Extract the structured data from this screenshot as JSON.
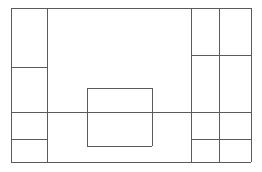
{
  "figure": {
    "title": "",
    "caption": "",
    "type": "layout-wireframe",
    "background_color": "#ffffff",
    "stroke_color": "#5a5a5a",
    "stroke_color_light": "#7a7a7a",
    "stroke_width": 1,
    "width": 262,
    "height": 172
  },
  "chart_data": {
    "type": "diagram",
    "title": "",
    "xlabel": "",
    "ylabel": "",
    "canvas": {
      "x": 11,
      "y": 8,
      "width": 240,
      "height": 154
    },
    "regions": [
      {
        "name": "left-sidebar-cell-1",
        "x": 11,
        "y": 8,
        "width": 36,
        "height": 59
      },
      {
        "name": "left-sidebar-cell-2",
        "x": 11,
        "y": 67,
        "width": 36,
        "height": 45
      },
      {
        "name": "left-sidebar-cell-3",
        "x": 11,
        "y": 112,
        "width": 36,
        "height": 27
      },
      {
        "name": "left-sidebar-cell-4",
        "x": 11,
        "y": 139,
        "width": 36,
        "height": 23
      },
      {
        "name": "main-content-upper",
        "x": 47,
        "y": 8,
        "width": 144,
        "height": 104
      },
      {
        "name": "main-content-lower",
        "x": 47,
        "y": 112,
        "width": 144,
        "height": 50
      },
      {
        "name": "right-inner-cell-1",
        "x": 191,
        "y": 8,
        "width": 28,
        "height": 47
      },
      {
        "name": "right-inner-cell-2",
        "x": 191,
        "y": 55,
        "width": 28,
        "height": 57
      },
      {
        "name": "right-inner-cell-3",
        "x": 191,
        "y": 112,
        "width": 28,
        "height": 27
      },
      {
        "name": "right-inner-cell-4",
        "x": 191,
        "y": 139,
        "width": 28,
        "height": 23
      },
      {
        "name": "right-outer-cell-1",
        "x": 219,
        "y": 8,
        "width": 32,
        "height": 47
      },
      {
        "name": "right-outer-cell-2",
        "x": 219,
        "y": 55,
        "width": 32,
        "height": 57
      },
      {
        "name": "right-outer-cell-3",
        "x": 219,
        "y": 112,
        "width": 32,
        "height": 27
      },
      {
        "name": "right-outer-cell-4",
        "x": 219,
        "y": 139,
        "width": 32,
        "height": 23
      },
      {
        "name": "center-floating-block",
        "x": 87,
        "y": 88,
        "width": 65,
        "height": 58
      }
    ],
    "lines": [
      {
        "name": "outer-frame-top",
        "orientation": "horizontal",
        "x1": 11,
        "y1": 8,
        "x2": 251,
        "y2": 8
      },
      {
        "name": "outer-frame-bottom",
        "orientation": "horizontal",
        "x1": 11,
        "y1": 162,
        "x2": 251,
        "y2": 162
      },
      {
        "name": "outer-frame-left",
        "orientation": "vertical",
        "x1": 11,
        "y1": 8,
        "x2": 11,
        "y2": 162
      },
      {
        "name": "outer-frame-right",
        "orientation": "vertical",
        "x1": 251,
        "y1": 8,
        "x2": 251,
        "y2": 162
      },
      {
        "name": "left-sidebar-divider",
        "orientation": "vertical",
        "x1": 47,
        "y1": 8,
        "x2": 47,
        "y2": 162
      },
      {
        "name": "right-inner-divider",
        "orientation": "vertical",
        "x1": 191,
        "y1": 8,
        "x2": 191,
        "y2": 162
      },
      {
        "name": "right-outer-divider",
        "orientation": "vertical",
        "x1": 219,
        "y1": 8,
        "x2": 219,
        "y2": 162
      },
      {
        "name": "left-rule-upper",
        "orientation": "horizontal",
        "x1": 11,
        "y1": 67,
        "x2": 47,
        "y2": 67
      },
      {
        "name": "left-rule-lower",
        "orientation": "horizontal",
        "x1": 11,
        "y1": 139,
        "x2": 47,
        "y2": 139
      },
      {
        "name": "right-rule-upper",
        "orientation": "horizontal",
        "x1": 191,
        "y1": 55,
        "x2": 251,
        "y2": 55
      },
      {
        "name": "right-rule-lower",
        "orientation": "horizontal",
        "x1": 191,
        "y1": 139,
        "x2": 251,
        "y2": 139
      },
      {
        "name": "full-width-rule",
        "orientation": "horizontal",
        "x1": 11,
        "y1": 112,
        "x2": 251,
        "y2": 112
      },
      {
        "name": "center-block-top",
        "orientation": "horizontal",
        "x1": 87,
        "y1": 88,
        "x2": 152,
        "y2": 88
      },
      {
        "name": "center-block-bottom",
        "orientation": "horizontal",
        "x1": 87,
        "y1": 146,
        "x2": 152,
        "y2": 146
      },
      {
        "name": "center-block-left",
        "orientation": "vertical",
        "x1": 87,
        "y1": 88,
        "x2": 87,
        "y2": 146
      },
      {
        "name": "center-block-right",
        "orientation": "vertical",
        "x1": 152,
        "y1": 88,
        "x2": 152,
        "y2": 146
      }
    ],
    "labels": [],
    "legend": [],
    "grid": false
  }
}
